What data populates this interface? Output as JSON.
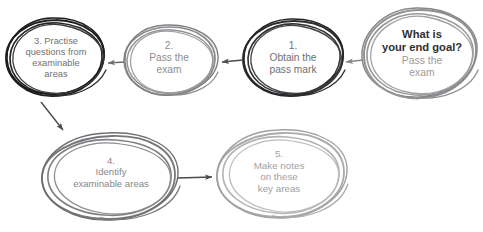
{
  "diagram": {
    "background_color": "#ffffff",
    "arrow_color": "#58595b",
    "nodes": [
      {
        "id": "goal",
        "role": "end-goal",
        "headline": "What is",
        "headline2": "your end goal?",
        "line1": "Pass the",
        "line2": "exam",
        "stroke_color": "#8e8f91",
        "text_color": "#9a9b9d",
        "headline_color": "#2f3031"
      },
      {
        "id": "node1",
        "number": "1.",
        "line1": "Obtain the",
        "line2": "pass mark",
        "stroke_color": "#2b2c2e",
        "text_color": "#6f7072"
      },
      {
        "id": "node2",
        "number": "2.",
        "line1": "Pass the",
        "line2": "exam",
        "stroke_color": "#8a8b8d",
        "text_color": "#8d8e90"
      },
      {
        "id": "node3",
        "number": "3. Practise",
        "line1": "questions from",
        "line2": "examinable",
        "line3": "areas",
        "stroke_color": "#1f2022",
        "text_color": "#6f7072"
      },
      {
        "id": "node4",
        "number": "4.",
        "line1": "Identify",
        "line2": "examinable areas",
        "stroke_color": "#76777a",
        "text_color": "#86878a"
      },
      {
        "id": "node5",
        "number": "5.",
        "line1": "Make notes",
        "line2": "on these",
        "line3": "key areas",
        "stroke_color": "#a9aaac",
        "text_color": "#a0a1a3"
      }
    ],
    "connectors": [
      {
        "id": "goal-to-node1",
        "from": "goal",
        "to": "node1",
        "direction": "left"
      },
      {
        "id": "node1-to-node2",
        "from": "node1",
        "to": "node2",
        "direction": "left"
      },
      {
        "id": "node2-to-node3",
        "from": "node2",
        "to": "node3",
        "direction": "left"
      },
      {
        "id": "node3-to-node4",
        "from": "node3",
        "to": "node4",
        "direction": "down-right"
      },
      {
        "id": "node4-to-node5",
        "from": "node4",
        "to": "node5",
        "direction": "right"
      }
    ]
  }
}
